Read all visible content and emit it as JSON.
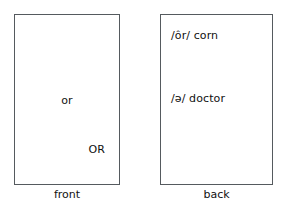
{
  "figure": {
    "background_color": "#ffffff",
    "text_color": "#111111",
    "border_color": "#555a5e"
  },
  "cards": [
    {
      "id": "front",
      "caption": "front",
      "lines": [
        {
          "text": "or",
          "align": "center"
        },
        {
          "text": "OR",
          "align": "right"
        }
      ]
    },
    {
      "id": "back",
      "caption": "back",
      "lines": [
        {
          "text": "/ôr/ corn",
          "align": "left"
        },
        {
          "text": "/ə/ doctor",
          "align": "left"
        }
      ]
    }
  ]
}
